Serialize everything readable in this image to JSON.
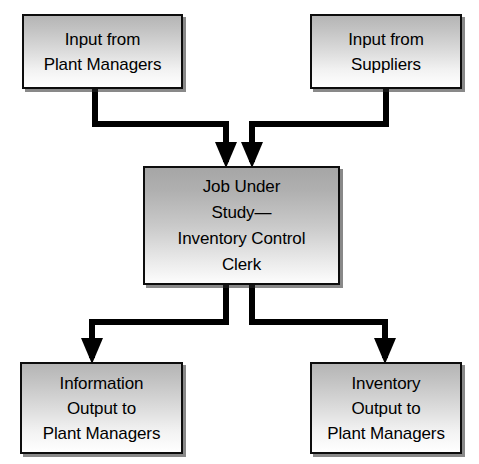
{
  "diagram": {
    "type": "flowchart",
    "colors": {
      "box_fill_top": "#b5b5b5",
      "box_fill_bottom": "#ffffff",
      "center_fill_top": "#a6a6a6",
      "border": "#0d0d0d",
      "connector": "#000000",
      "background": "#ffffff"
    },
    "nodes": [
      {
        "id": "input-plant-managers",
        "role": "input",
        "label": "Input from\nPlant Managers",
        "x": 22,
        "y": 14,
        "width": 161,
        "height": 75
      },
      {
        "id": "input-suppliers",
        "role": "input",
        "label": "Input from\nSuppliers",
        "x": 310,
        "y": 14,
        "width": 152,
        "height": 75
      },
      {
        "id": "job-under-study",
        "role": "process",
        "label": "Job Under\nStudy—\nInventory Control\nClerk",
        "x": 143,
        "y": 166,
        "width": 197,
        "height": 119
      },
      {
        "id": "output-information",
        "role": "output",
        "label": "Information\nOutput to\nPlant Managers",
        "x": 20,
        "y": 362,
        "width": 163,
        "height": 92
      },
      {
        "id": "output-inventory",
        "role": "output",
        "label": "Inventory\nOutput to\nPlant Managers",
        "x": 310,
        "y": 362,
        "width": 152,
        "height": 92
      }
    ],
    "edges": [
      {
        "id": "edge-plant-managers-to-job",
        "from": "input-plant-managers",
        "to": "job-under-study",
        "points": "95,89 95,124 226,124 226,160",
        "arrow_at": "226,166"
      },
      {
        "id": "edge-suppliers-to-job",
        "from": "input-suppliers",
        "to": "job-under-study",
        "points": "386,89 386,124 252,124 252,160",
        "arrow_at": "252,166"
      },
      {
        "id": "edge-job-to-information",
        "from": "job-under-study",
        "to": "output-information",
        "points": "226,285 226,322 92,322 92,356",
        "arrow_at": "92,362"
      },
      {
        "id": "edge-job-to-inventory",
        "from": "job-under-study",
        "to": "output-inventory",
        "points": "252,285 252,322 385,322 385,356",
        "arrow_at": "385,362"
      }
    ]
  }
}
